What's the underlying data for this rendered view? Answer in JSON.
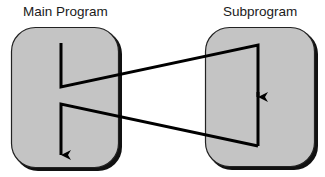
{
  "nodes": [
    {
      "id": "main",
      "label": "Main Program"
    },
    {
      "id": "sub",
      "label": "Subprogram"
    }
  ],
  "edges": [
    {
      "from": "main",
      "to": "sub",
      "description": "call: control transfers from main program to subprogram"
    },
    {
      "from": "sub",
      "to": "main",
      "description": "return: control returns from subprogram to main program"
    }
  ],
  "colors": {
    "box_fill": "#c4c4c4",
    "box_border": "#111111",
    "line": "#000000",
    "background": "#ffffff"
  }
}
